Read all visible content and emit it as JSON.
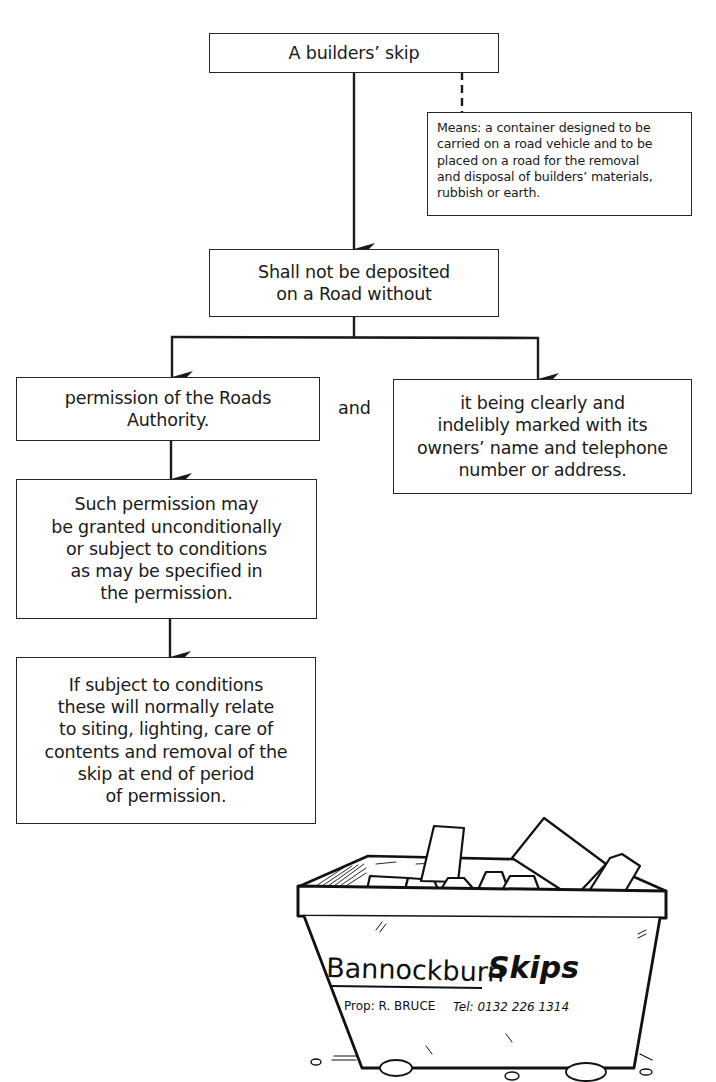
{
  "diagram": {
    "title_box": {
      "text": "A builders’ skip"
    },
    "definition_box": {
      "text": "Means: a container designed to be\ncarried on a road vehicle and to be\nplaced on a road for the removal\nand disposal of builders’ materials,\nrubbish or earth."
    },
    "rule_box": {
      "text": "Shall not be deposited\non a Road without"
    },
    "condition_left": {
      "text": "permission of the Roads\nAuthority."
    },
    "conjunction": {
      "text": "and"
    },
    "condition_right": {
      "text": "it being clearly and\nindelibly marked with its\nowners’ name and telephone\nnumber or address."
    },
    "permission_box": {
      "text": "Such permission may\nbe granted unconditionally\nor subject to conditions\nas may be specified in\nthe permission."
    },
    "conditions_box": {
      "text": "If subject to conditions\nthese will normally relate\nto siting, lighting, care of\ncontents and removal of the\nskip at end of period\nof permission."
    },
    "connectors": {
      "line_color": "#1a1a1a",
      "title_to_definition": "dashed",
      "title_to_rule": "arrow",
      "rule_to_conditions": "branching-arrow",
      "left_to_permission": "arrow",
      "permission_to_conditions": "arrow"
    }
  },
  "illustration": {
    "subject": "builders' skip filled with rubble",
    "company_name_part1": "Bannockburn",
    "company_name_part2": "Skips",
    "proprietor": "Prop: R. BRUCE",
    "telephone": "Tel: 0132 226 1314"
  }
}
